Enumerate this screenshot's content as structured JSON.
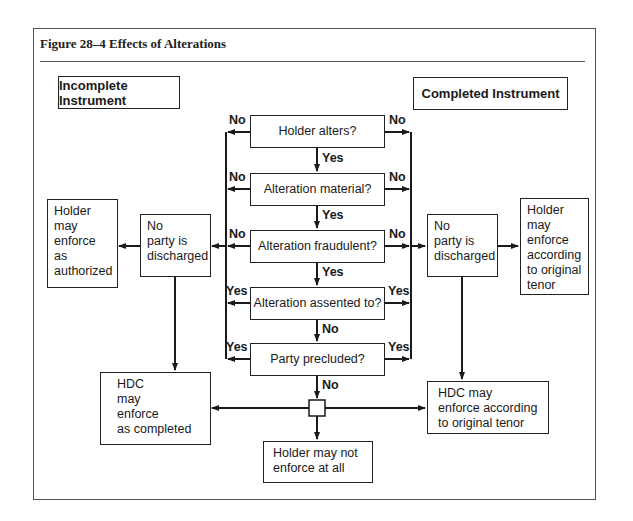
{
  "figure": {
    "title": "Figure 28–4  Effects of Alterations"
  },
  "headers": {
    "left": "Incomplete Instrument",
    "right": "Completed Instrument"
  },
  "decisions": [
    {
      "label": "Holder alters?",
      "left_branch": "No",
      "right_branch": "No",
      "down_branch": "Yes"
    },
    {
      "label": "Alteration material?",
      "left_branch": "No",
      "right_branch": "No",
      "down_branch": "Yes"
    },
    {
      "label": "Alteration fraudulent?",
      "left_branch": "No",
      "right_branch": "No",
      "down_branch": "Yes"
    },
    {
      "label": "Alteration assented to?",
      "left_branch": "Yes",
      "right_branch": "Yes",
      "down_branch": "No"
    },
    {
      "label": "Party precluded?",
      "left_branch": "Yes",
      "right_branch": "Yes",
      "down_branch": "No"
    }
  ],
  "outcomes": {
    "left_no_discharge": "No\nparty is\ndischarged",
    "right_no_discharge": "No\nparty is\ndischarged",
    "left_holder": "Holder\nmay\nenforce\nas\nauthorized",
    "right_holder": "Holder\nmay\nenforce\naccording\nto original\ntenor",
    "left_hdc": "HDC\nmay\nenforce\nas completed",
    "right_hdc": "HDC may\nenforce according\nto original tenor",
    "bottom": "Holder may not\nenforce at all"
  },
  "colors": {
    "line": "#1a1a1a",
    "frame": "#555555",
    "background": "#ffffff"
  }
}
